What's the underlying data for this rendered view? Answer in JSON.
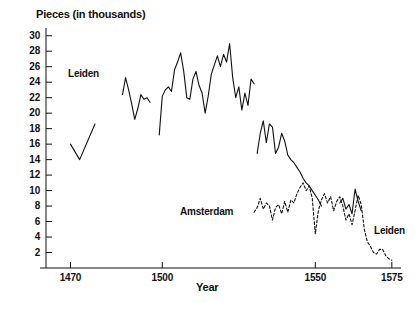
{
  "chart": {
    "type": "line",
    "y_axis_title": "Pieces (in thousands)",
    "x_axis_title": "Year",
    "labels": {
      "leiden_left": "Leiden",
      "leiden_right": "Leiden",
      "amsterdam": "Amsterdam"
    },
    "ink_color": "#111111"
  },
  "axes": {
    "y_ticks": [
      2,
      4,
      6,
      8,
      10,
      12,
      14,
      16,
      18,
      20,
      22,
      24,
      26,
      28,
      30
    ],
    "y_tick_labels": [
      "2",
      "4",
      "6",
      "8",
      "10",
      "12",
      "14",
      "16",
      "18",
      "20",
      "22",
      "24",
      "26",
      "28",
      "30"
    ],
    "x_ticks": [
      1470,
      1500,
      1550,
      1575
    ],
    "x_tick_labels": [
      "1470",
      "1500",
      "1550",
      "1575"
    ],
    "xlim": [
      1462,
      1578
    ],
    "ylim": [
      0,
      31
    ],
    "grid": false
  },
  "chart_data": {
    "type": "line",
    "title": "",
    "xlabel": "Year",
    "ylabel": "Pieces (in thousands)",
    "xlim": [
      1462,
      1578
    ],
    "ylim": [
      0,
      31
    ],
    "grid": false,
    "legend": "inline-annotations",
    "series": [
      {
        "name": "Leiden",
        "style": "solid",
        "color": "#111111",
        "segments": [
          {
            "note": "early segment 1470-1478",
            "x": [
              1470,
              1473,
              1478
            ],
            "y": [
              16.0,
              14.0,
              18.6
            ]
          },
          {
            "note": "1487-1497 cluster",
            "x": [
              1487,
              1488,
              1489,
              1490,
              1491,
              1492,
              1493,
              1494,
              1495,
              1496
            ],
            "y": [
              22.4,
              24.6,
              23.0,
              21.2,
              19.2,
              20.6,
              22.4,
              21.8,
              22.0,
              21.4
            ]
          },
          {
            "note": "1499-1530 main high plateau",
            "x": [
              1499,
              1500,
              1501,
              1502,
              1503,
              1504,
              1505,
              1506,
              1507,
              1508,
              1509,
              1510,
              1511,
              1512,
              1513,
              1514,
              1515,
              1516,
              1517,
              1518,
              1519,
              1520,
              1521,
              1522,
              1523,
              1524,
              1525,
              1526,
              1527,
              1528,
              1529,
              1530
            ],
            "y": [
              17.2,
              22.2,
              23.0,
              23.4,
              22.8,
              25.6,
              26.6,
              27.8,
              25.4,
              22.0,
              21.8,
              24.4,
              25.4,
              23.6,
              22.6,
              20.0,
              22.2,
              25.0,
              26.2,
              27.4,
              26.0,
              27.6,
              26.6,
              29.0,
              24.6,
              22.0,
              23.4,
              20.4,
              22.6,
              21.0,
              24.4,
              23.8
            ]
          },
          {
            "note": "1531-1552 decline",
            "x": [
              1531,
              1532,
              1533,
              1534,
              1535,
              1536,
              1537,
              1538,
              1539,
              1540,
              1541,
              1542,
              1543,
              1544,
              1545,
              1546,
              1547,
              1548,
              1549,
              1550,
              1551,
              1552
            ],
            "y": [
              14.8,
              17.4,
              19.0,
              16.2,
              18.6,
              18.2,
              14.8,
              15.6,
              17.4,
              16.4,
              14.6,
              14.0,
              13.6,
              13.0,
              12.4,
              11.6,
              11.0,
              10.6,
              10.0,
              9.4,
              8.8,
              8.0
            ]
          },
          {
            "note": "1558-1565 late spikes",
            "x": [
              1558,
              1559,
              1560,
              1561,
              1562,
              1563,
              1564,
              1565
            ],
            "y": [
              8.4,
              9.0,
              7.6,
              8.2,
              7.0,
              10.2,
              8.6,
              7.4
            ]
          }
        ]
      },
      {
        "name": "Amsterdam",
        "style": "dashed",
        "color": "#111111",
        "segments": [
          {
            "note": "1530-1575 dashed series",
            "x": [
              1530,
              1531,
              1532,
              1533,
              1534,
              1535,
              1536,
              1537,
              1538,
              1539,
              1540,
              1541,
              1542,
              1543,
              1544,
              1545,
              1546,
              1547,
              1548,
              1549,
              1550,
              1551,
              1552,
              1553,
              1554,
              1555,
              1556,
              1557,
              1558,
              1559,
              1560,
              1561,
              1562,
              1563,
              1564,
              1565,
              1566,
              1567,
              1568,
              1569,
              1570,
              1571,
              1572,
              1573,
              1574,
              1575
            ],
            "y": [
              7.2,
              7.8,
              9.0,
              7.6,
              8.4,
              8.0,
              6.2,
              7.8,
              8.2,
              7.0,
              8.6,
              7.2,
              8.8,
              8.4,
              9.6,
              10.4,
              11.0,
              10.0,
              10.6,
              9.0,
              4.4,
              7.4,
              8.8,
              9.6,
              8.4,
              9.2,
              7.4,
              8.6,
              9.2,
              8.0,
              6.2,
              7.0,
              5.6,
              7.4,
              9.4,
              8.2,
              5.0,
              3.4,
              2.8,
              2.0,
              1.8,
              2.4,
              2.4,
              1.6,
              1.2,
              1.0
            ]
          }
        ]
      }
    ]
  }
}
